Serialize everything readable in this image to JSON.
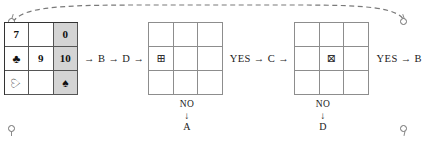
{
  "page": {
    "background_color": "#ffffff",
    "ink_color": "#1a1a1a",
    "shade_color": "#d4d4d4"
  },
  "corner_markers": [
    {
      "name": "top-left-pin"
    },
    {
      "name": "top-right-pin"
    },
    {
      "name": "bottom-left-pin"
    },
    {
      "name": "bottom-right-pin"
    }
  ],
  "grids": [
    {
      "id": "grid-1",
      "shaded_column": 3,
      "cells": [
        {
          "text": "7",
          "kind": "number",
          "shaded": false
        },
        {
          "text": "",
          "kind": "empty",
          "shaded": false
        },
        {
          "text": "0",
          "kind": "number",
          "shaded": true
        },
        {
          "text": "♣",
          "kind": "suit-club-outline",
          "shaded": false
        },
        {
          "text": "6",
          "kind": "number-rotated-180",
          "shaded": false
        },
        {
          "text": "10",
          "kind": "number",
          "shaded": true
        },
        {
          "text": "♡",
          "kind": "suit-heart-outline-rotated",
          "shaded": false
        },
        {
          "text": "",
          "kind": "empty",
          "shaded": false
        },
        {
          "text": "♠",
          "kind": "suit-spade-filled",
          "shaded": true
        }
      ]
    },
    {
      "id": "grid-2",
      "shaded_column": 0,
      "cells": [
        {
          "text": "",
          "kind": "empty",
          "shaded": false
        },
        {
          "text": "",
          "kind": "empty",
          "shaded": false
        },
        {
          "text": "",
          "kind": "empty",
          "shaded": false
        },
        {
          "text": "⊞",
          "kind": "squared-plus",
          "shaded": false
        },
        {
          "text": "",
          "kind": "empty",
          "shaded": false
        },
        {
          "text": "",
          "kind": "empty",
          "shaded": false
        },
        {
          "text": "",
          "kind": "empty",
          "shaded": false
        },
        {
          "text": "",
          "kind": "empty",
          "shaded": false
        },
        {
          "text": "",
          "kind": "empty",
          "shaded": false
        }
      ]
    },
    {
      "id": "grid-3",
      "shaded_column": 0,
      "cells": [
        {
          "text": "",
          "kind": "empty",
          "shaded": false
        },
        {
          "text": "",
          "kind": "empty",
          "shaded": false
        },
        {
          "text": "",
          "kind": "empty",
          "shaded": false
        },
        {
          "text": "",
          "kind": "empty",
          "shaded": false
        },
        {
          "text": "⊠",
          "kind": "squared-times",
          "shaded": false
        },
        {
          "text": "",
          "kind": "empty",
          "shaded": false
        },
        {
          "text": "",
          "kind": "empty",
          "shaded": false
        },
        {
          "text": "",
          "kind": "empty",
          "shaded": false
        },
        {
          "text": "",
          "kind": "empty",
          "shaded": false
        }
      ]
    }
  ],
  "connectors": {
    "before_grid2": "→ B → D →",
    "between_grid2_grid3": "YES → C →",
    "after_grid3": "YES → B"
  },
  "branches": [
    {
      "id": "branch-a",
      "condition": "NO",
      "arrow": "↓",
      "target": "A"
    },
    {
      "id": "branch-d",
      "condition": "NO",
      "arrow": "↓",
      "target": "D"
    }
  ]
}
